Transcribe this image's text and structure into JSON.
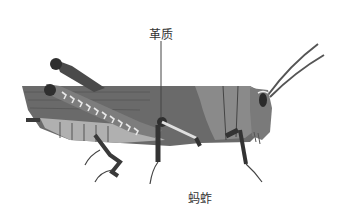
{
  "figure": {
    "labels": {
      "wing_label": "革质",
      "caption": "蚂蚱"
    },
    "colors": {
      "body_dark": "#5a5a5a",
      "body_mid": "#7a7a7a",
      "body_light": "#9a9a9a",
      "belly": "#b5b5b5",
      "leg_dark": "#3a3a3a",
      "chevron": "#e8e8e8",
      "leader_line": "#444444"
    }
  }
}
